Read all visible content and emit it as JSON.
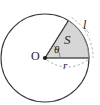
{
  "figure": {
    "kind": "circle-sector-geometry-diagram",
    "labels": {
      "centre": "O",
      "angle": "θ",
      "area": "S",
      "arc_length": "l",
      "radius": "r"
    },
    "colors": {
      "stroke": "#3a3a3a",
      "sector_fill": "#d6d6d6",
      "sector_stroke": "#6e6e6e",
      "dash_stroke": "#9a9a9a",
      "text": "#1c1c1c",
      "background": "#ffffff"
    },
    "geometry": {
      "centre_x": 45,
      "centre_y": 58,
      "radius_px": 44,
      "sector_start_angle_deg": 0,
      "sector_end_angle_deg": 58,
      "radius_line_end_x": 89,
      "radius_line_end_y": 58,
      "sector_edge_end_x": 68.3,
      "sector_edge_end_y": 20.7
    }
  }
}
